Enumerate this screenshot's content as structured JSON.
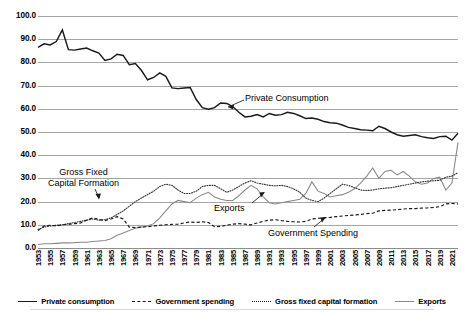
{
  "chart_data": {
    "type": "line",
    "title": "",
    "subtitle": "",
    "xlabel": "",
    "ylabel": "",
    "ylim": [
      0.0,
      100.0
    ],
    "yticks": [
      "0.0",
      "10.0",
      "20.0",
      "30.0",
      "40.0",
      "50.0",
      "60.0",
      "70.0",
      "80.0",
      "90.0",
      "100.0"
    ],
    "grid": true,
    "legend_position": "bottom",
    "xlim": [
      1953,
      2022
    ],
    "x": [
      1953,
      1954,
      1955,
      1956,
      1957,
      1958,
      1959,
      1960,
      1961,
      1962,
      1963,
      1964,
      1965,
      1966,
      1967,
      1968,
      1969,
      1970,
      1971,
      1972,
      1973,
      1974,
      1975,
      1976,
      1977,
      1978,
      1979,
      1980,
      1981,
      1982,
      1983,
      1984,
      1985,
      1986,
      1987,
      1988,
      1989,
      1990,
      1991,
      1992,
      1993,
      1994,
      1995,
      1996,
      1997,
      1998,
      1999,
      2000,
      2001,
      2002,
      2003,
      2004,
      2005,
      2006,
      2007,
      2008,
      2009,
      2010,
      2011,
      2012,
      2013,
      2014,
      2015,
      2016,
      2017,
      2018,
      2019,
      2020,
      2021,
      2022
    ],
    "xticks": [
      "1953",
      "1955",
      "1957",
      "1959",
      "1961",
      "1963",
      "1965",
      "1967",
      "1969",
      "1971",
      "1973",
      "1975",
      "1977",
      "1979",
      "1981",
      "1983",
      "1985",
      "1987",
      "1989",
      "1991",
      "1993",
      "1995",
      "1997",
      "1999",
      "2001",
      "2003",
      "2005",
      "2007",
      "2009",
      "2011",
      "2013",
      "2015",
      "2017",
      "2019",
      "2021"
    ],
    "series": [
      {
        "name": "Private consumption",
        "style": "solid",
        "color": "#1a1a1a",
        "values": [
          86.5,
          88.0,
          87.5,
          89.0,
          94.0,
          85.5,
          85.3,
          85.8,
          86.2,
          85.0,
          84.0,
          80.8,
          81.5,
          83.5,
          83.0,
          79.0,
          79.5,
          76.5,
          72.5,
          73.5,
          75.5,
          74.0,
          69.0,
          68.7,
          69.0,
          69.2,
          64.0,
          60.5,
          59.8,
          60.5,
          62.5,
          62.3,
          61.0,
          58.5,
          56.5,
          56.8,
          57.5,
          56.5,
          58.0,
          57.2,
          57.5,
          58.5,
          58.0,
          57.0,
          55.8,
          56.0,
          55.5,
          54.5,
          54.0,
          53.8,
          53.0,
          52.0,
          51.5,
          51.0,
          50.8,
          50.5,
          52.5,
          51.5,
          50.0,
          48.8,
          48.2,
          48.5,
          48.8,
          48.0,
          47.5,
          47.2,
          48.0,
          48.2,
          46.5,
          49.5
        ]
      },
      {
        "name": "Government spending",
        "style": "dashed",
        "color": "#1a1a1a",
        "values": [
          7.5,
          9.5,
          9.8,
          9.5,
          10.0,
          10.2,
          10.5,
          10.8,
          12.0,
          13.0,
          12.3,
          11.8,
          12.5,
          13.5,
          12.5,
          9.0,
          8.8,
          9.0,
          9.2,
          9.5,
          9.8,
          10.0,
          10.2,
          10.3,
          10.8,
          11.2,
          11.0,
          11.3,
          11.0,
          9.2,
          9.3,
          9.8,
          10.3,
          10.5,
          10.3,
          10.0,
          10.8,
          11.5,
          12.0,
          12.2,
          11.8,
          11.5,
          11.3,
          11.2,
          11.5,
          12.5,
          12.8,
          13.0,
          13.2,
          13.5,
          13.8,
          14.0,
          14.2,
          14.5,
          14.8,
          15.0,
          16.0,
          16.2,
          16.3,
          16.5,
          16.8,
          17.0,
          17.0,
          17.2,
          17.3,
          17.5,
          17.8,
          19.0,
          19.2,
          19.0
        ]
      },
      {
        "name": "Gross fixed capital formation",
        "style": "dotted",
        "color": "#3a3a3a",
        "values": [
          8.0,
          9.0,
          9.5,
          9.8,
          10.0,
          10.5,
          11.0,
          11.5,
          12.0,
          12.5,
          12.0,
          12.2,
          13.0,
          14.5,
          16.0,
          18.0,
          20.0,
          21.5,
          23.0,
          24.5,
          26.5,
          27.5,
          27.0,
          25.0,
          23.5,
          23.5,
          24.5,
          26.5,
          27.0,
          27.0,
          25.5,
          24.0,
          25.0,
          26.5,
          28.0,
          29.0,
          28.0,
          27.5,
          27.0,
          26.8,
          27.0,
          26.5,
          25.5,
          24.0,
          21.5,
          20.5,
          20.0,
          21.5,
          23.5,
          25.5,
          27.5,
          27.0,
          26.0,
          25.0,
          24.8,
          25.0,
          25.5,
          25.8,
          26.0,
          26.5,
          27.0,
          27.5,
          28.0,
          28.5,
          28.8,
          29.0,
          29.2,
          30.5,
          31.0,
          32.5
        ]
      },
      {
        "name": "Exports",
        "style": "solid",
        "color": "#8a8a8a",
        "values": [
          1.5,
          1.8,
          1.8,
          2.0,
          2.2,
          2.2,
          2.3,
          2.5,
          2.5,
          2.8,
          3.0,
          3.2,
          4.0,
          5.5,
          6.5,
          7.5,
          8.5,
          9.0,
          9.5,
          10.5,
          13.0,
          16.0,
          19.0,
          20.5,
          20.0,
          19.5,
          21.5,
          23.0,
          24.0,
          22.0,
          21.0,
          20.5,
          20.5,
          22.5,
          25.0,
          27.0,
          25.5,
          22.0,
          19.5,
          19.0,
          19.5,
          20.0,
          20.5,
          21.0,
          23.5,
          28.5,
          24.5,
          23.5,
          22.0,
          22.5,
          23.0,
          24.0,
          25.5,
          28.0,
          31.0,
          34.5,
          30.0,
          33.0,
          33.5,
          31.5,
          33.0,
          31.0,
          28.5,
          27.5,
          28.0,
          30.0,
          30.5,
          25.0,
          28.0,
          45.5
        ]
      }
    ],
    "annotations": [
      {
        "id": "private-consumption",
        "text": "Private Consumption"
      },
      {
        "id": "gross-fixed-capital-formation",
        "line1": "Gross Fixed",
        "line2": "Capital Formation"
      },
      {
        "id": "exports",
        "text": "Exports"
      },
      {
        "id": "government-spending",
        "text": "Government Spending"
      }
    ],
    "legend": [
      {
        "label": "Private consumption",
        "style": "solid",
        "color": "#1a1a1a"
      },
      {
        "label": "Government spending",
        "style": "dashed",
        "color": "#1a1a1a"
      },
      {
        "label": "Gross fixed capital formation",
        "style": "dotted",
        "color": "#3a3a3a"
      },
      {
        "label": "Exports",
        "style": "solid",
        "color": "#8a8a8a"
      }
    ]
  }
}
